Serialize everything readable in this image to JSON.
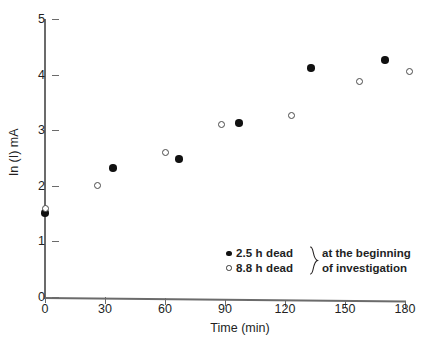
{
  "chart_data": {
    "type": "scatter",
    "title": "",
    "xlabel": "Time (min)",
    "ylabel": "ln (I) mA",
    "xlim": [
      0,
      180
    ],
    "ylim": [
      0,
      5
    ],
    "xticks": [
      0,
      30,
      60,
      90,
      120,
      150,
      180
    ],
    "yticks": [
      0,
      1,
      2,
      3,
      4,
      5
    ],
    "grid": false,
    "legend_position": "inside-lower-right",
    "series": [
      {
        "name": "2.5 h dead",
        "marker": "filled-circle",
        "color": "#111111",
        "points": [
          {
            "x": 0,
            "y": 1.51
          },
          {
            "x": 34,
            "y": 2.32
          },
          {
            "x": 67,
            "y": 2.48
          },
          {
            "x": 97,
            "y": 3.13
          },
          {
            "x": 133,
            "y": 4.12
          },
          {
            "x": 170,
            "y": 4.26
          }
        ]
      },
      {
        "name": "8.8 h dead",
        "marker": "open-circle",
        "color": "#4a4a4a",
        "points": [
          {
            "x": 0,
            "y": 1.6
          },
          {
            "x": 26,
            "y": 2.0
          },
          {
            "x": 60,
            "y": 2.6
          },
          {
            "x": 88,
            "y": 3.11
          },
          {
            "x": 123,
            "y": 3.27
          },
          {
            "x": 157,
            "y": 3.87
          },
          {
            "x": 182,
            "y": 4.06
          }
        ]
      }
    ],
    "annotations": []
  },
  "axes": {
    "x_title": "Time (min)",
    "y_title": "ln (I) mA",
    "x_tick_labels": [
      "0",
      "30",
      "60",
      "90",
      "120",
      "150",
      "180"
    ],
    "y_tick_labels": [
      "0",
      "1",
      "2",
      "3",
      "4",
      "5"
    ]
  },
  "legend": {
    "rows": [
      {
        "marker": "filled-circle",
        "label": "2.5 h dead"
      },
      {
        "marker": "open-circle",
        "label": "8.8 h dead"
      }
    ],
    "note_lines": [
      "at the beginning",
      "of investigation"
    ]
  }
}
